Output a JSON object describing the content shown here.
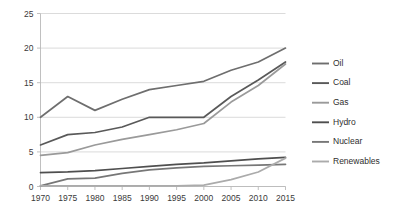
{
  "chart_data": {
    "type": "line",
    "title": "",
    "xlabel": "",
    "ylabel": "",
    "categories": [
      "1970",
      "1975",
      "1980",
      "1985",
      "1990",
      "1995",
      "2000",
      "2005",
      "2010",
      "2015"
    ],
    "x": [
      1970,
      1975,
      1980,
      1985,
      1990,
      1995,
      2000,
      2005,
      2010,
      2015
    ],
    "ylim": [
      0,
      25
    ],
    "yticks": [
      0,
      5,
      10,
      15,
      20,
      25
    ],
    "ytick_labels": [
      "0",
      "5",
      "10",
      "15",
      "20",
      "25"
    ],
    "grid": true,
    "grid_axis": "y",
    "legend_position": "right",
    "series": [
      {
        "name": "Oil",
        "color": "#6e6e6e",
        "values": [
          10.0,
          13.0,
          11.0,
          12.6,
          14.0,
          14.6,
          15.2,
          16.8,
          18.0,
          20.0
        ]
      },
      {
        "name": "Coal",
        "color": "#595959",
        "values": [
          6.0,
          7.5,
          7.8,
          8.6,
          10.0,
          10.0,
          10.0,
          13.0,
          15.4,
          18.0
        ]
      },
      {
        "name": "Gas",
        "color": "#9a9a9a",
        "values": [
          4.5,
          4.9,
          6.0,
          6.8,
          7.5,
          8.2,
          9.1,
          12.2,
          14.6,
          17.7
        ]
      },
      {
        "name": "Hydro",
        "color": "#4f4f4f",
        "values": [
          2.0,
          2.1,
          2.3,
          2.6,
          2.9,
          3.2,
          3.4,
          3.7,
          4.0,
          4.2
        ]
      },
      {
        "name": "Nuclear",
        "color": "#777777",
        "values": [
          0.1,
          1.1,
          1.2,
          1.9,
          2.4,
          2.7,
          2.9,
          3.0,
          3.1,
          3.2
        ]
      },
      {
        "name": "Renewables",
        "color": "#ababab",
        "values": [
          0.1,
          0.1,
          0.1,
          0.1,
          0.1,
          0.1,
          0.2,
          1.0,
          2.1,
          4.1
        ]
      }
    ]
  },
  "legend": {
    "items": [
      {
        "label": "Oil"
      },
      {
        "label": "Coal"
      },
      {
        "label": "Gas"
      },
      {
        "label": "Hydro"
      },
      {
        "label": "Nuclear"
      },
      {
        "label": "Renewables"
      }
    ]
  },
  "axes": {
    "y_tick_labels": [
      "25",
      "20",
      "15",
      "10",
      "5",
      "0"
    ],
    "x_tick_labels": [
      "1970",
      "1975",
      "1980",
      "1985",
      "1990",
      "1995",
      "2000",
      "2005",
      "2010",
      "2015"
    ]
  }
}
